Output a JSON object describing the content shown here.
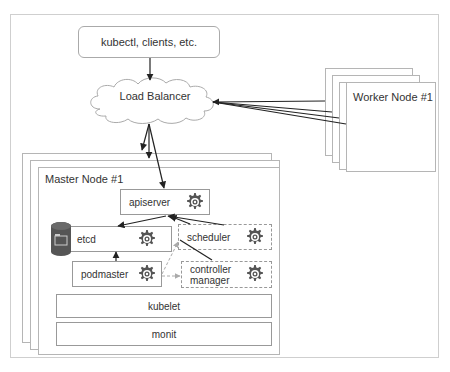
{
  "diagram": {
    "clients_label": "kubectl, clients, etc.",
    "load_balancer_label": "Load Balancer",
    "worker_nodes": {
      "front_label": "Worker Node #1",
      "stack_count": 4
    },
    "master_nodes": {
      "front_label": "Master Node #1",
      "stack_count": 3
    },
    "components": {
      "apiserver": "apiserver",
      "etcd": "etcd",
      "scheduler": "scheduler",
      "controller_manager_line1": "controller",
      "controller_manager_line2": "manager",
      "podmaster": "podmaster",
      "kubelet": "kubelet",
      "monit": "monit"
    },
    "icons": {
      "gear": "gear-icon",
      "database": "database-cylinder-icon",
      "cloud": "cloud-shape"
    },
    "colors": {
      "border": "#999999",
      "gear": "#555555",
      "cylinder": "#555555",
      "arrow": "#222222",
      "dashed_arrow": "#aaaaaa"
    }
  }
}
